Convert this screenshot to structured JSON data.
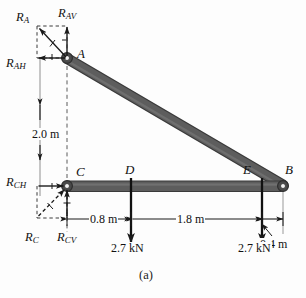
{
  "figure": {
    "caption": "(a)",
    "type": "free-body-diagram",
    "colors": {
      "member": "#585858",
      "member_edge": "#3a3a3a",
      "line": "#1a1a1a",
      "construction": "#888888",
      "background": "#fdfdfd"
    }
  },
  "joints": [
    {
      "id": "A",
      "label": "A",
      "x": 67,
      "y": 58,
      "kind": "pin"
    },
    {
      "id": "C",
      "label": "C",
      "x": 67,
      "y": 186,
      "kind": "pin"
    },
    {
      "id": "D",
      "label": "D",
      "x": 131,
      "y": 186,
      "kind": "load-point"
    },
    {
      "id": "E",
      "label": "E",
      "x": 262,
      "y": 186,
      "kind": "load-point"
    },
    {
      "id": "B",
      "label": "B",
      "x": 283,
      "y": 186,
      "kind": "pin"
    }
  ],
  "members": [
    {
      "id": "AB",
      "from": "A",
      "to": "B",
      "orientation": "diagonal"
    },
    {
      "id": "CB",
      "from": "C",
      "to": "B",
      "orientation": "horizontal"
    }
  ],
  "reactions": {
    "at_A": {
      "resultant": {
        "label": "R",
        "sub": "A",
        "direction": "up-left"
      },
      "vertical": {
        "label": "R",
        "sub": "AV",
        "direction": "up"
      },
      "horizontal": {
        "label": "R",
        "sub": "AH",
        "direction": "left"
      }
    },
    "at_C": {
      "resultant": {
        "label": "R",
        "sub": "C",
        "direction": "up-right"
      },
      "vertical": {
        "label": "R",
        "sub": "CV",
        "direction": "up"
      },
      "horizontal": {
        "label": "R",
        "sub": "CH",
        "direction": "right"
      }
    }
  },
  "loads": [
    {
      "at": "D",
      "magnitude": "2.7 kN",
      "direction": "down"
    },
    {
      "at": "E",
      "magnitude": "2.7 kN",
      "direction": "down"
    }
  ],
  "dimensions": [
    {
      "id": "height_AC",
      "value": "2.0 m",
      "between": [
        "C",
        "A"
      ],
      "orientation": "vertical"
    },
    {
      "id": "span_CD",
      "value": "0.8 m",
      "between": [
        "C",
        "D"
      ],
      "orientation": "horizontal"
    },
    {
      "id": "span_DE",
      "value": "1.8 m",
      "between": [
        "D",
        "E"
      ],
      "orientation": "horizontal"
    },
    {
      "id": "span_EB",
      "value": "0.4 m",
      "between": [
        "E",
        "B"
      ],
      "orientation": "horizontal"
    }
  ]
}
